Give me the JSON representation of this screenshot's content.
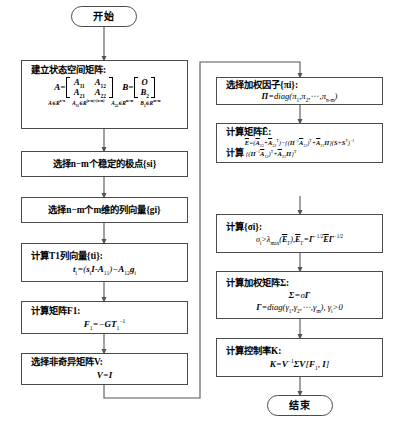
{
  "diagram": {
    "start_label": "开始",
    "end_label": "结束",
    "colors": {
      "box_border": "#4a4a4a",
      "connector": "#555555",
      "background": "#ffffff",
      "text": "#000000"
    },
    "left_column": [
      {
        "id": "state-space",
        "header": "建立状态空间矩阵:",
        "matrix_A_label": "A=",
        "matrix_A_cells": [
          [
            "A11",
            "A12"
          ],
          [
            "A21",
            "A22"
          ]
        ],
        "matrix_B_label": "B=",
        "matrix_B_cells": [
          [
            "O"
          ],
          [
            "B2"
          ]
        ],
        "dimensions": [
          "A∈R n×n",
          "A11∈R (n-m)×(n-m)",
          "A22∈R m×m",
          "B2∈R m×m"
        ]
      },
      {
        "id": "choose-poles",
        "header": "选择n−m个稳定的极点{si}"
      },
      {
        "id": "choose-vectors",
        "header": "选择n−m个m维的列向量{gi}"
      },
      {
        "id": "compute-T1",
        "header": "计算T1列向量{ti}:",
        "formula": "ti=(siI−A11)−A12gi"
      },
      {
        "id": "compute-F1",
        "header": "计算矩阵F1:",
        "formula": "F1=−GT1−1"
      },
      {
        "id": "choose-V",
        "header": "选择非奇异矩阵V:",
        "formula": "V=I"
      }
    ],
    "right_column": [
      {
        "id": "weight-factors",
        "header": "选择加权因子{πi}:",
        "formula": "Π=diag(π1,π2,⋯,πn-m)"
      },
      {
        "id": "compute-E",
        "header": "计算矩阵Ē:",
        "formula1": "Ē=(Ā22+Ā22ᵀ)−{(Π−1Ā12)ᵀ+Ā21Π}(S+Sᵀ)−1",
        "formula2_prefix": "计算",
        "formula2": "{(Π−1Ā12)ᵀ+Ā21Π}ᵀ"
      },
      {
        "id": "compute-sigma",
        "header": "计算{σi}:",
        "formula": "σi>λmax(ĒΓ),ĒΓ=Γ−1/2ĒΓ−1/2"
      },
      {
        "id": "compute-Sigma",
        "header": "计算加权矩阵Σ:",
        "formula1": "Σ=σΓ",
        "formula2": "Γ=diag(γ1,γ2,⋯,γm), γi>0"
      },
      {
        "id": "compute-K",
        "header": "计算控制率K:",
        "formula": "K=V−1ΣV[F1, I]"
      }
    ]
  }
}
